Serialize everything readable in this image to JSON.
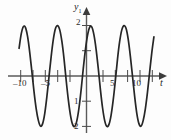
{
  "figure": {
    "name": "sinusoid-plot",
    "background_color": "#fdfdfd",
    "curve_color": "#262626",
    "axis_color": "#5a5a5a"
  },
  "axes": {
    "y_axis_label": "y",
    "y_axis_label_sub": "1",
    "x_axis_label": "t"
  },
  "chart_data": {
    "type": "line",
    "title": "",
    "xlabel": "t",
    "ylabel": "y1",
    "xlim": [
      -12.6,
      12.6
    ],
    "ylim": [
      -2.6,
      2.6
    ],
    "grid": false,
    "legend": "none",
    "function": "y = 2*cos(2*pi*t/4.55)",
    "amplitude": 2,
    "period": 4.55,
    "x_ticks": [
      -10,
      -5,
      5,
      10
    ],
    "x_tick_labels": [
      "-10",
      "-5",
      "5",
      "10"
    ],
    "x_minor_ticks": [
      -11.4,
      -9.1,
      -6.8,
      -4.55,
      -2.3,
      2.3,
      4.55,
      6.8,
      9.1,
      11.4
    ],
    "y_ticks": [
      2,
      1,
      -1,
      -2
    ],
    "y_tick_labels": [
      "2",
      "1",
      "1",
      "2"
    ],
    "series": [
      {
        "name": "y1",
        "x": [
          -12.6,
          -12.2,
          -11.8,
          -11.4,
          -11.0,
          -10.6,
          -10.2,
          -9.8,
          -9.4,
          -9.0,
          -8.6,
          -8.2,
          -7.8,
          -7.4,
          -7.0,
          -6.6,
          -6.2,
          -5.8,
          -5.4,
          -5.0,
          -4.6,
          -4.2,
          -3.8,
          -3.4,
          -3.0,
          -2.6,
          -2.2,
          -1.8,
          -1.4,
          -1.0,
          -0.6,
          -0.2,
          0.2,
          0.6,
          1.0,
          1.4,
          1.8,
          2.2,
          2.6,
          3.0,
          3.4,
          3.8,
          4.2,
          4.6,
          5.0,
          5.4,
          5.8,
          6.2,
          6.6,
          7.0,
          7.4,
          7.8,
          8.2,
          8.6,
          9.0,
          9.4,
          9.8,
          10.2,
          10.6,
          11.0,
          11.4,
          11.8,
          12.2,
          12.6
        ],
        "y": [
          1.1,
          1.67,
          1.96,
          1.92,
          1.55,
          0.92,
          0.15,
          -0.64,
          -1.3,
          -1.76,
          -1.99,
          -1.89,
          -1.48,
          -0.81,
          -0.01,
          0.78,
          1.45,
          1.88,
          2.0,
          1.83,
          1.37,
          0.68,
          -0.17,
          -0.94,
          -1.55,
          -1.92,
          -2.0,
          -1.77,
          -1.26,
          -0.54,
          0.3,
          1.05,
          1.62,
          1.94,
          1.94,
          1.62,
          1.05,
          0.3,
          -0.54,
          -1.26,
          -1.77,
          -2.0,
          -1.92,
          -1.55,
          -0.94,
          -0.17,
          0.68,
          1.37,
          1.83,
          2.0,
          1.88,
          1.45,
          0.78,
          -0.01,
          -0.81,
          -1.48,
          -1.89,
          -1.99,
          -1.76,
          -1.3,
          -0.64,
          0.15,
          0.92,
          1.55
        ]
      }
    ]
  }
}
